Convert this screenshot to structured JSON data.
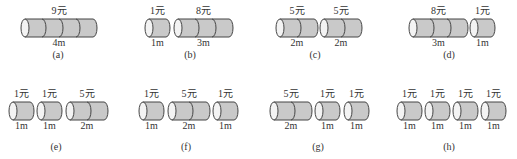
{
  "colors": {
    "body": "#c9c9c9",
    "cap": "#f3f3f3",
    "stroke": "#454545",
    "text": "#333333"
  },
  "figures": [
    {
      "caption": "(a)",
      "cylinders": [
        {
          "price": "9元",
          "length": "4m",
          "segments": 4
        }
      ]
    },
    {
      "caption": "(b)",
      "cylinders": [
        {
          "price": "1元",
          "length": "1m",
          "segments": 1
        },
        {
          "price": "8元",
          "length": "3m",
          "segments": 3
        }
      ]
    },
    {
      "caption": "(c)",
      "cylinders": [
        {
          "price": "5元",
          "length": "2m",
          "segments": 2
        },
        {
          "price": "5元",
          "length": "2m",
          "segments": 2
        }
      ]
    },
    {
      "caption": "(d)",
      "cylinders": [
        {
          "price": "8元",
          "length": "3m",
          "segments": 3
        },
        {
          "price": "1元",
          "length": "1m",
          "segments": 1
        }
      ]
    },
    {
      "caption": "(e)",
      "cylinders": [
        {
          "price": "1元",
          "length": "1m",
          "segments": 1
        },
        {
          "price": "1元",
          "length": "1m",
          "segments": 1
        },
        {
          "price": "5元",
          "length": "2m",
          "segments": 2
        }
      ]
    },
    {
      "caption": "(f)",
      "cylinders": [
        {
          "price": "1元",
          "length": "1m",
          "segments": 1
        },
        {
          "price": "5元",
          "length": "2m",
          "segments": 2
        },
        {
          "price": "1元",
          "length": "1m",
          "segments": 1
        }
      ]
    },
    {
      "caption": "(g)",
      "cylinders": [
        {
          "price": "5元",
          "length": "2m",
          "segments": 2
        },
        {
          "price": "1元",
          "length": "1m",
          "segments": 1
        },
        {
          "price": "1元",
          "length": "1m",
          "segments": 1
        }
      ]
    },
    {
      "caption": "(h)",
      "cylinders": [
        {
          "price": "1元",
          "length": "1m",
          "segments": 1
        },
        {
          "price": "1元",
          "length": "1m",
          "segments": 1
        },
        {
          "price": "1元",
          "length": "1m",
          "segments": 1
        },
        {
          "price": "1元",
          "length": "1m",
          "segments": 1
        }
      ]
    }
  ]
}
